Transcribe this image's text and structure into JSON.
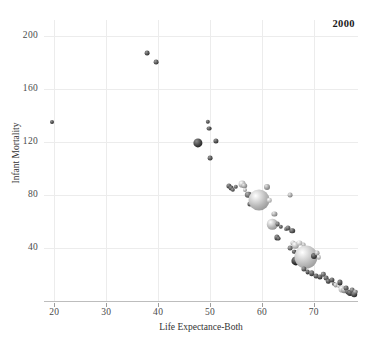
{
  "chart_data": {
    "type": "scatter",
    "title": "",
    "annotation": "2000",
    "xlabel": "Life Expectance-Both",
    "ylabel": "Infant Mortality",
    "xlim": [
      18,
      78.5
    ],
    "ylim": [
      0,
      212
    ],
    "xticks": [
      20,
      30,
      40,
      50,
      60,
      70
    ],
    "yticks": [
      40,
      80,
      120,
      160,
      200
    ],
    "grid": true,
    "legend": null,
    "size_encodes": "population",
    "color_scale": "grayscale",
    "points": [
      {
        "x": 19.6,
        "y": 135,
        "r": 2.0,
        "g": 0.28
      },
      {
        "x": 37.8,
        "y": 187,
        "r": 2.4,
        "g": 0.3
      },
      {
        "x": 39.6,
        "y": 180,
        "r": 2.4,
        "g": 0.32
      },
      {
        "x": 47.6,
        "y": 119,
        "r": 4.6,
        "g": 0.26
      },
      {
        "x": 49.6,
        "y": 135,
        "r": 2.2,
        "g": 0.3
      },
      {
        "x": 49.8,
        "y": 130,
        "r": 2.4,
        "g": 0.3
      },
      {
        "x": 50.0,
        "y": 108,
        "r": 2.4,
        "g": 0.32
      },
      {
        "x": 51.2,
        "y": 121,
        "r": 2.6,
        "g": 0.3
      },
      {
        "x": 53.6,
        "y": 87,
        "r": 2.6,
        "g": 0.33
      },
      {
        "x": 54.0,
        "y": 85,
        "r": 2.4,
        "g": 0.3
      },
      {
        "x": 54.4,
        "y": 84,
        "r": 2.2,
        "g": 0.34
      },
      {
        "x": 55.0,
        "y": 86,
        "r": 2.2,
        "g": 0.36
      },
      {
        "x": 56.2,
        "y": 88,
        "r": 3.4,
        "g": 0.7
      },
      {
        "x": 56.6,
        "y": 87,
        "r": 2.8,
        "g": 0.62
      },
      {
        "x": 56.8,
        "y": 84,
        "r": 2.0,
        "g": 0.66
      },
      {
        "x": 57.4,
        "y": 80,
        "r": 3.2,
        "g": 0.4
      },
      {
        "x": 57.6,
        "y": 73,
        "r": 2.6,
        "g": 0.34
      },
      {
        "x": 58.2,
        "y": 76,
        "r": 2.4,
        "g": 0.3
      },
      {
        "x": 59.4,
        "y": 76,
        "r": 10.5,
        "g": 0.72
      },
      {
        "x": 61.0,
        "y": 86,
        "r": 3.0,
        "g": 0.6
      },
      {
        "x": 61.4,
        "y": 76,
        "r": 2.2,
        "g": 0.74
      },
      {
        "x": 62.4,
        "y": 66,
        "r": 2.6,
        "g": 0.62
      },
      {
        "x": 62.0,
        "y": 58,
        "r": 5.2,
        "g": 0.7
      },
      {
        "x": 63.0,
        "y": 58,
        "r": 2.4,
        "g": 0.38
      },
      {
        "x": 63.6,
        "y": 56,
        "r": 2.2,
        "g": 0.34
      },
      {
        "x": 62.8,
        "y": 48,
        "r": 2.6,
        "g": 0.32
      },
      {
        "x": 63.2,
        "y": 47,
        "r": 2.4,
        "g": 0.3
      },
      {
        "x": 64.6,
        "y": 54,
        "r": 2.0,
        "g": 0.44
      },
      {
        "x": 65.4,
        "y": 80,
        "r": 2.4,
        "g": 0.62
      },
      {
        "x": 65.0,
        "y": 55,
        "r": 2.6,
        "g": 0.36
      },
      {
        "x": 65.8,
        "y": 53,
        "r": 2.8,
        "g": 0.32
      },
      {
        "x": 66.0,
        "y": 44,
        "r": 2.6,
        "g": 0.68
      },
      {
        "x": 66.4,
        "y": 42,
        "r": 3.2,
        "g": 0.72
      },
      {
        "x": 65.4,
        "y": 40,
        "r": 2.4,
        "g": 0.4
      },
      {
        "x": 66.2,
        "y": 37,
        "r": 2.2,
        "g": 0.3
      },
      {
        "x": 67.2,
        "y": 44,
        "r": 2.6,
        "g": 0.76
      },
      {
        "x": 68.0,
        "y": 42,
        "r": 2.4,
        "g": 0.64
      },
      {
        "x": 66.6,
        "y": 30,
        "r": 4.6,
        "g": 0.2
      },
      {
        "x": 68.4,
        "y": 33,
        "r": 11.5,
        "g": 0.74
      },
      {
        "x": 70.0,
        "y": 34,
        "r": 3.0,
        "g": 0.26
      },
      {
        "x": 70.6,
        "y": 36,
        "r": 2.4,
        "g": 0.66
      },
      {
        "x": 71.0,
        "y": 33,
        "r": 2.2,
        "g": 0.72
      },
      {
        "x": 68.0,
        "y": 24,
        "r": 2.6,
        "g": 0.36
      },
      {
        "x": 68.8,
        "y": 22,
        "r": 2.4,
        "g": 0.3
      },
      {
        "x": 69.6,
        "y": 21,
        "r": 2.8,
        "g": 0.34
      },
      {
        "x": 70.4,
        "y": 19,
        "r": 2.4,
        "g": 0.32
      },
      {
        "x": 71.2,
        "y": 18,
        "r": 2.6,
        "g": 0.3
      },
      {
        "x": 71.8,
        "y": 20,
        "r": 2.2,
        "g": 0.38
      },
      {
        "x": 72.4,
        "y": 17,
        "r": 2.4,
        "g": 0.34
      },
      {
        "x": 72.8,
        "y": 15,
        "r": 2.2,
        "g": 0.3
      },
      {
        "x": 73.4,
        "y": 16,
        "r": 2.6,
        "g": 0.32
      },
      {
        "x": 73.8,
        "y": 13,
        "r": 2.2,
        "g": 0.36
      },
      {
        "x": 74.2,
        "y": 12,
        "r": 2.4,
        "g": 0.66
      },
      {
        "x": 74.8,
        "y": 11,
        "r": 2.0,
        "g": 0.7
      },
      {
        "x": 75.0,
        "y": 14,
        "r": 2.6,
        "g": 0.3
      },
      {
        "x": 75.4,
        "y": 9,
        "r": 3.4,
        "g": 0.74
      },
      {
        "x": 75.8,
        "y": 8,
        "r": 2.8,
        "g": 0.6
      },
      {
        "x": 76.2,
        "y": 10,
        "r": 2.4,
        "g": 0.34
      },
      {
        "x": 76.6,
        "y": 7,
        "r": 2.6,
        "g": 0.3
      },
      {
        "x": 77.0,
        "y": 6,
        "r": 3.0,
        "g": 0.26
      },
      {
        "x": 77.4,
        "y": 8,
        "r": 2.4,
        "g": 0.4
      },
      {
        "x": 77.8,
        "y": 5,
        "r": 2.8,
        "g": 0.28
      },
      {
        "x": 78.0,
        "y": 7,
        "r": 2.2,
        "g": 0.5
      }
    ]
  },
  "axes": {
    "x_title": "Life Expectance-Both",
    "y_title": "Infant Mortality",
    "x_tick_labels": [
      "20",
      "30",
      "40",
      "50",
      "60",
      "70"
    ],
    "y_tick_labels": [
      "40",
      "80",
      "120",
      "160",
      "200"
    ]
  },
  "style": {
    "grid_color": "#ececec",
    "axis_color": "#bdbdbd",
    "text_color": "#4a4a4a",
    "background": "#ffffff"
  }
}
